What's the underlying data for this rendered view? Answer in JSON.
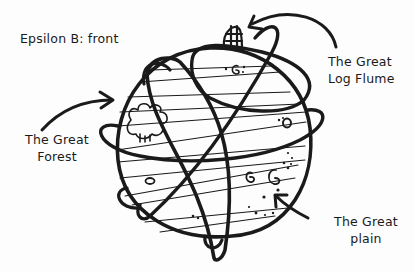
{
  "diagram": {
    "title": "Epsilon B: front",
    "colors": {
      "ink": "#1a1a1a",
      "paper": "#fdfdfd"
    },
    "labels": [
      {
        "id": "forest",
        "lines": [
          "The Great",
          "Forest"
        ]
      },
      {
        "id": "flume",
        "lines": [
          "The Great",
          "Log Flume"
        ]
      },
      {
        "id": "plain",
        "lines": [
          "The Great",
          "plain"
        ]
      }
    ],
    "features": [
      {
        "name": "planet",
        "shape": "circle"
      },
      {
        "name": "forest",
        "glyph": "cloud-tree"
      },
      {
        "name": "log-flume",
        "glyph": "ladder-dome"
      },
      {
        "name": "plain",
        "glyph": "swirls-and-dots"
      }
    ]
  }
}
